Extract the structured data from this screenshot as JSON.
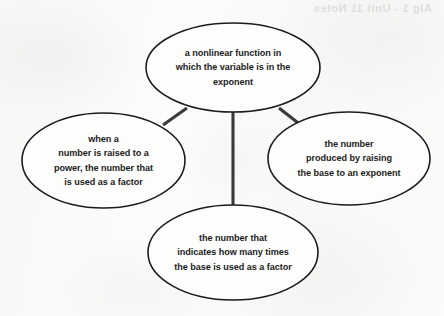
{
  "diagram": {
    "type": "concept-map",
    "background_color": "#fbfbfa",
    "stroke_color": "#1c1c1c",
    "connector_color": "#3a3a3a",
    "text_color": "#1b1b1b",
    "bleed_through_text": "Alg 1 - Unit 11 Notes"
  },
  "nodes": [
    {
      "id": "top",
      "name": "ellipse-top",
      "lines": [
        "a nonlinear function in",
        "which the variable is in the",
        "exponent"
      ],
      "x": 146,
      "y": 23,
      "width": 174,
      "height": 89
    },
    {
      "id": "left",
      "name": "ellipse-left",
      "lines": [
        "when a",
        "number is raised to a",
        "power, the number that",
        "is used as a factor"
      ],
      "x": 22,
      "y": 113,
      "width": 163,
      "height": 95
    },
    {
      "id": "right",
      "name": "ellipse-right",
      "lines": [
        "the number",
        "produced by raising",
        "the base to an exponent"
      ],
      "x": 268,
      "y": 112,
      "width": 162,
      "height": 93
    },
    {
      "id": "bottom",
      "name": "ellipse-bottom",
      "lines": [
        "the number that",
        "indicates how many times",
        "the base is used as a factor"
      ],
      "x": 148,
      "y": 205,
      "width": 170,
      "height": 95
    }
  ],
  "connectors": [
    {
      "id": "top-to-bottom",
      "name": "connector-top-bottom",
      "x1": 233,
      "y1": 110,
      "x2": 233,
      "y2": 207
    },
    {
      "id": "top-to-left",
      "name": "connector-top-left",
      "x1": 187,
      "y1": 108,
      "x2": 163,
      "y2": 125
    },
    {
      "id": "top-to-right",
      "name": "connector-top-right",
      "x1": 279,
      "y1": 108,
      "x2": 302,
      "y2": 126
    }
  ]
}
